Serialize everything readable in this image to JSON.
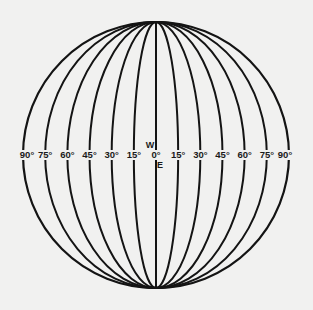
{
  "diagram": {
    "type": "globular-projection-meridians",
    "center": {
      "x": 156,
      "y": 155
    },
    "radius": 133,
    "meridian_step_deg": 15,
    "stroke_color": "#141414",
    "background_color": "#f1f1f0",
    "west_labels": [
      "90°",
      "75°",
      "60°",
      "45°",
      "30°",
      "15°"
    ],
    "center_label": "0°",
    "east_labels": [
      "15°",
      "30°",
      "45°",
      "60°",
      "75°",
      "90°"
    ],
    "west_marker": "W",
    "east_marker": "E"
  }
}
